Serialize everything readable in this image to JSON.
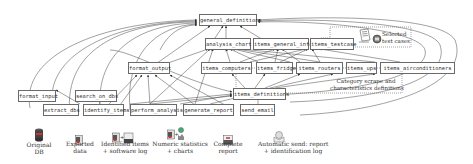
{
  "diagram": {
    "nodes": {
      "general_definitions": "general_definitions",
      "analysis_chart": "analysis_chart",
      "items_general_info": "items_general_info",
      "items_testcase": "items_testcase",
      "format_output": "format_output",
      "items_computers": "items_computers",
      "items_fridges": "items_fridges",
      "items_routers": "items_routers",
      "items_ups": "items_ups",
      "items_airconditioners": "items_airconditioners",
      "format_input": "format_input",
      "search_on_dbs": "search_on_dbs",
      "items_definitions": "items_definitions",
      "extract_dbs": "extract_dbs",
      "identify_items": "identify_items",
      "perform_analysis": "perform_analysis",
      "generate_report": "generate_report",
      "send_email": "send_email"
    },
    "annotations": {
      "selected_test_cases_line1": "Selected",
      "selected_test_cases_line2": "test cases",
      "category_line1": "Category scrape and",
      "category_line2": "characteristics definitions"
    },
    "pipeline": [
      {
        "line1": "Original",
        "line2": "DB",
        "icon": "database-icon"
      },
      {
        "line1": "Exported",
        "line2": "data",
        "icon": "spreadsheet-file-icon"
      },
      {
        "line1": "Identified items",
        "line2": "+ software log",
        "icon": "file-and-log-icon"
      },
      {
        "line1": "Numeric statistics",
        "line2": "+ charts",
        "icon": "stats-charts-icon"
      },
      {
        "line1": "Complete",
        "line2": "report",
        "icon": "report-icon"
      },
      {
        "line1": "Automatic send: report",
        "line2": "+ identification log",
        "icon": "email-icon"
      }
    ]
  }
}
